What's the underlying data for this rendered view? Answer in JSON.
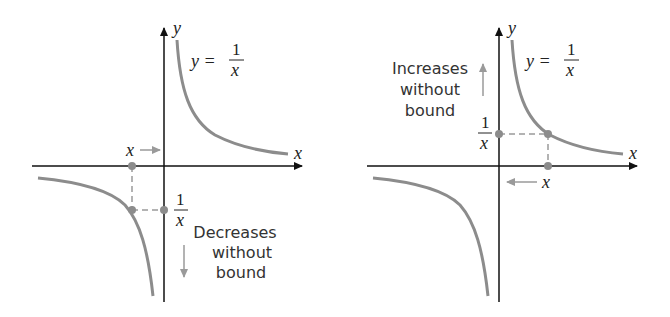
{
  "figure": {
    "left_panel": {
      "equation": {
        "lhs": "y =",
        "numerator": "1",
        "denominator": "x"
      },
      "axis_x_label": "x",
      "axis_y_label": "y",
      "point_label_x": "x",
      "point_label_reciprocal": {
        "numerator": "1",
        "denominator": "x"
      },
      "annotation_lines": [
        "Decreases",
        "without",
        "bound"
      ],
      "description": "As x approaches 0 from the left, 1/x decreases without bound"
    },
    "right_panel": {
      "equation": {
        "lhs": "y =",
        "numerator": "1",
        "denominator": "x"
      },
      "axis_x_label": "x",
      "axis_y_label": "y",
      "point_label_x": "x",
      "point_label_reciprocal": {
        "numerator": "1",
        "denominator": "x"
      },
      "annotation_lines": [
        "Increases",
        "without",
        "bound"
      ],
      "description": "As x approaches 0 from the right, 1/x increases without bound"
    },
    "colors": {
      "axis": "#111111",
      "curve": "#8c8c8c",
      "guide": "#9a9a9a",
      "text": "#222222"
    }
  }
}
